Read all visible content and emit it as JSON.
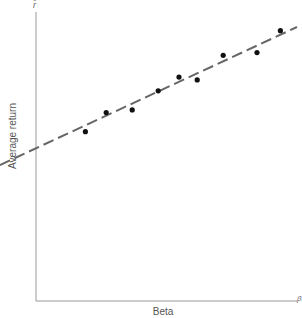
{
  "chart_data": {
    "type": "scatter",
    "title": "",
    "xlabel": "Beta",
    "ylabel": "Average return",
    "y_axis_symbol": "r̄",
    "x_axis_symbol": "β",
    "grid": false,
    "legend": null,
    "xlim": [
      0,
      1
    ],
    "ylim": [
      0,
      1
    ],
    "points": [
      {
        "x": 0.19,
        "y": 0.62
      },
      {
        "x": 0.27,
        "y": 0.69
      },
      {
        "x": 0.37,
        "y": 0.7
      },
      {
        "x": 0.47,
        "y": 0.77
      },
      {
        "x": 0.55,
        "y": 0.82
      },
      {
        "x": 0.62,
        "y": 0.81
      },
      {
        "x": 0.72,
        "y": 0.9
      },
      {
        "x": 0.85,
        "y": 0.91
      },
      {
        "x": 0.94,
        "y": 0.99
      }
    ],
    "fit_line": {
      "style": "dashed",
      "x": [
        -0.14,
        1.0
      ],
      "y": [
        0.51,
        1.01
      ]
    },
    "pixel_mapping": {
      "x0_px": 36,
      "x1_px": 296,
      "y0_px": 301,
      "y1_px": 28
    }
  },
  "colors": {
    "axis": "#888888",
    "points": "#111111",
    "line": "#666666",
    "text": "#555555"
  }
}
